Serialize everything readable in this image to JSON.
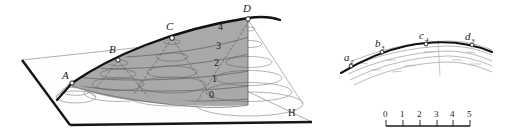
{
  "figure": {
    "title_visible": false,
    "colors": {
      "shaded_surface": "#a9a9a9",
      "shaded_surface_light": "#c4c4c4",
      "crest_line": "#111111",
      "contour_line": "#6b6b6b",
      "plane_edge": "#1a1a1a",
      "plane_fill": "#fefefe",
      "background": "#ffffff",
      "point_marker_fill": "#ffffff",
      "point_marker_stroke": "#111111"
    },
    "left_panel": {
      "name": "perspective-block-diagram",
      "crest_points": [
        {
          "id": "A",
          "label": "A"
        },
        {
          "id": "B",
          "label": "B"
        },
        {
          "id": "C",
          "label": "C"
        },
        {
          "id": "D",
          "label": "D"
        }
      ],
      "contour_labels": [
        "4",
        "3",
        "2",
        "1",
        "0"
      ],
      "plane_label": "H"
    },
    "right_panel": {
      "name": "map-view-diagram",
      "crest_points": [
        {
          "id": "a",
          "label": "a",
          "sub": "2"
        },
        {
          "id": "b",
          "label": "b",
          "sub": "3"
        },
        {
          "id": "c",
          "label": "c",
          "sub": "4"
        },
        {
          "id": "d",
          "label": "d",
          "sub": "3"
        }
      ],
      "scale_bar": {
        "ticks": [
          "0",
          "1",
          "2",
          "3",
          "4",
          "5"
        ],
        "units_visible": false
      }
    }
  }
}
